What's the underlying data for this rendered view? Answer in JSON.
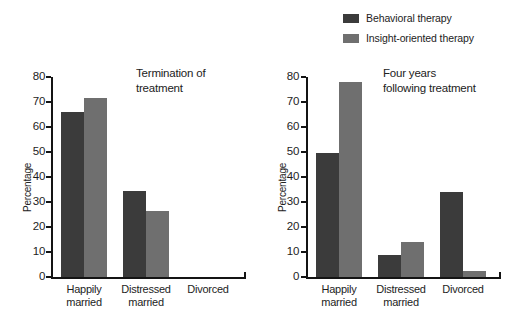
{
  "figure": {
    "ylabel": "Percentage",
    "legend": {
      "position": "top-right",
      "items": [
        {
          "label": "Behavioral therapy",
          "color": "#3b3b3b",
          "icon": "legend-swatch-icon"
        },
        {
          "label": "Insight-oriented therapy",
          "color": "#6f6f6f",
          "icon": "legend-swatch-icon"
        }
      ]
    },
    "panels": [
      {
        "annotation_line1": "Termination of",
        "annotation_line2": "treatment"
      },
      {
        "annotation_line1": "Four years",
        "annotation_line2": "following treatment"
      }
    ],
    "category_labels": [
      {
        "line1": "Happily",
        "line2": "married"
      },
      {
        "line1": "Distressed",
        "line2": "married"
      },
      {
        "line1": "Divorced",
        "line2": ""
      }
    ],
    "yticks": [
      "0",
      "10",
      "20",
      "30",
      "40",
      "50",
      "60",
      "70",
      "80"
    ]
  },
  "chart_data": [
    {
      "type": "bar",
      "title": "Termination of treatment",
      "categories": [
        "Happily married",
        "Distressed married",
        "Divorced"
      ],
      "series": [
        {
          "name": "Behavioral therapy",
          "color": "#3b3b3b",
          "values": [
            66,
            34.5,
            0
          ]
        },
        {
          "name": "Insight-oriented therapy",
          "color": "#6f6f6f",
          "values": [
            71.5,
            26.5,
            0
          ]
        }
      ],
      "xlabel": "",
      "ylabel": "Percentage",
      "ylim": [
        0,
        80
      ],
      "ytick_step": 10,
      "grid": false,
      "legend_position": "top-right"
    },
    {
      "type": "bar",
      "title": "Four years following treatment",
      "categories": [
        "Happily married",
        "Distressed married",
        "Divorced"
      ],
      "series": [
        {
          "name": "Behavioral therapy",
          "color": "#3b3b3b",
          "values": [
            49.5,
            9,
            34
          ]
        },
        {
          "name": "Insight-oriented therapy",
          "color": "#6f6f6f",
          "values": [
            78,
            14,
            2.5
          ]
        }
      ],
      "xlabel": "",
      "ylabel": "Percentage",
      "ylim": [
        0,
        80
      ],
      "ytick_step": 10,
      "grid": false,
      "legend_position": "top-right"
    }
  ]
}
